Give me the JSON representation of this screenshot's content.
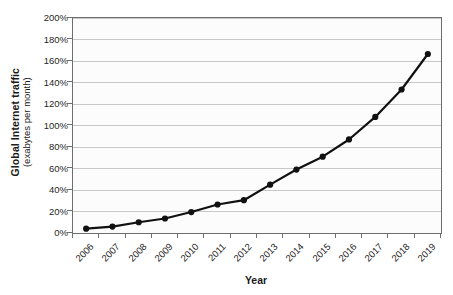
{
  "chart_data": {
    "type": "line",
    "title": "",
    "xlabel": "Year",
    "ylabel": "Global Internet traffic",
    "ylabel_line1": "Global Internet traffic",
    "ylabel_line2": "(exabytes per month)",
    "categories": [
      "2006",
      "2007",
      "2008",
      "2009",
      "2010",
      "2011",
      "2012",
      "2013",
      "2014",
      "2015",
      "2016",
      "2017",
      "2018",
      "2019"
    ],
    "values": [
      4,
      6,
      10,
      13.5,
      19.5,
      26.5,
      30.5,
      45,
      59,
      71,
      87,
      108,
      133.5,
      166.5
    ],
    "ytick_labels": [
      "0%",
      "20%",
      "40%",
      "60%",
      "80%",
      "100%",
      "120%",
      "140%",
      "160%",
      "180%",
      "200%"
    ],
    "ytick_values": [
      0,
      20,
      40,
      60,
      80,
      100,
      120,
      140,
      160,
      180,
      200
    ],
    "ylim": [
      0,
      200
    ],
    "grid": true,
    "legend": "none",
    "series_color": "#111111",
    "marker": "circle",
    "gridline_color": "#c8c8c8",
    "axis_color": "#6e6e6e",
    "plot_background": "#fcfcfc"
  }
}
